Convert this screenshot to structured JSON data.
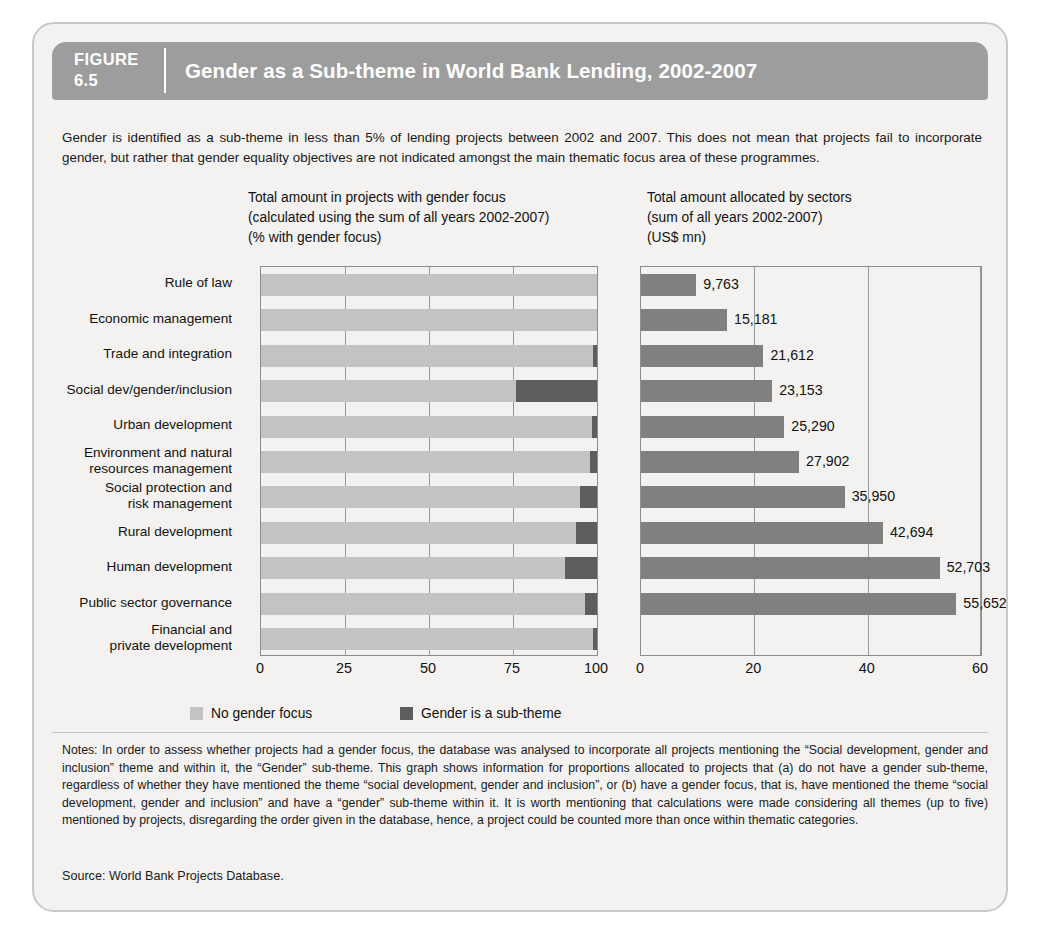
{
  "figure": {
    "number_label": "FIGURE",
    "number": "6.5",
    "title": "Gender as a Sub-theme in World Bank Lending, 2002-2007"
  },
  "intro": "Gender is identified as a sub-theme in less than 5% of lending projects between 2002 and 2007. This does not mean that projects fail to incorporate gender, but rather that gender equality objectives are not indicated amongst the main thematic focus area of these programmes.",
  "legend": {
    "items": [
      {
        "label": "No gender focus",
        "color": "#c3c3c3"
      },
      {
        "label": "Gender is a sub-theme",
        "color": "#5d5d5d"
      }
    ]
  },
  "notes": "Notes: In order to assess whether projects had a gender focus, the database was analysed to incorporate all projects mentioning the “Social development, gender and inclusion” theme and within it, the “Gender” sub-theme. This graph shows information for proportions allocated to projects that (a) do not have a gender sub-theme, regardless of whether they have mentioned the theme “social development, gender and inclusion”, or (b) have a gender focus, that is, have mentioned the theme “social development, gender and inclusion” and have a “gender” sub-theme within it. It is worth mentioning that calculations were made considering all themes (up to five) mentioned by projects, disregarding the order given in the database, hence, a project could be counted more than once within thematic categories.",
  "source": "Source: World Bank Projects Database.",
  "chart_data": [
    {
      "type": "bar",
      "orientation": "horizontal",
      "stacked": true,
      "id": "left-chart",
      "title": "Total amount in projects with gender focus\n(calculated using the sum of all years 2002-2007)\n(% with gender focus)",
      "xlabel": "",
      "ylabel": "",
      "xlim": [
        0,
        100
      ],
      "xticks": [
        0,
        25,
        50,
        75,
        100
      ],
      "grid": true,
      "categories": [
        "Rule of law",
        "Economic management",
        "Trade and integration",
        "Social dev/gender/inclusion",
        "Urban development",
        "Environment and natural\nresources management",
        "Social protection and\nrisk management",
        "Rural development",
        "Human development",
        "Public sector governance",
        "Financial and\nprivate development"
      ],
      "series": [
        {
          "name": "No gender focus",
          "color": "#c3c3c3",
          "values": [
            100,
            100,
            98.7,
            76.0,
            98.5,
            98.0,
            94.8,
            93.8,
            90.5,
            96.5,
            98.8
          ]
        },
        {
          "name": "Gender is a sub-theme",
          "color": "#5d5d5d",
          "values": [
            0,
            0,
            1.3,
            24.0,
            1.5,
            2.0,
            5.2,
            6.2,
            9.5,
            3.5,
            1.2
          ]
        }
      ]
    },
    {
      "type": "bar",
      "orientation": "horizontal",
      "stacked": false,
      "id": "right-chart",
      "title": "Total amount allocated by sectors\n(sum of all years 2002-2007)\n(US$ mn)",
      "xlabel": "",
      "ylabel": "",
      "xlim": [
        0,
        60
      ],
      "xticks": [
        0,
        20,
        40,
        60
      ],
      "grid": true,
      "units": "US$ mn (thousands on axis)",
      "categories": [
        "Rule of law",
        "Economic management",
        "Trade and integration",
        "Social dev/gender/inclusion",
        "Urban development",
        "Environment and natural resources management",
        "Social protection and risk management",
        "Rural development",
        "Human development",
        "Public sector governance",
        "Financial and private development"
      ],
      "values": [
        9763,
        15181,
        21612,
        23153,
        25290,
        27902,
        35950,
        42694,
        52703,
        55652
      ],
      "series": [
        {
          "name": "Total amount allocated",
          "color": "#808080",
          "values": [
            9.763,
            15.181,
            21.612,
            23.153,
            25.29,
            27.902,
            35.95,
            42.694,
            52.703,
            55.652
          ],
          "labels": [
            "9,763",
            "15,181",
            "21,612",
            "23,153",
            "25,290",
            "27,902",
            "35,950",
            "42,694",
            "52,703",
            "55,652"
          ]
        }
      ]
    }
  ]
}
